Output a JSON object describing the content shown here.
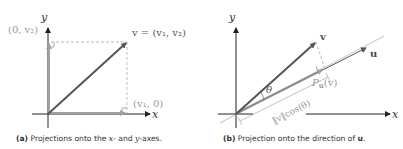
{
  "panel_a": {
    "axis_x": "x",
    "axis_y": "y",
    "label_v": "v = (v₁, v₂)",
    "label_proj_y": "(0, v₂)",
    "label_proj_x": "(v₁, 0)",
    "caption_tag": "(a)",
    "caption_pre": "Projections onto the ",
    "caption_x": "x",
    "caption_mid": "- and ",
    "caption_y": "y",
    "caption_post": "-axes."
  },
  "panel_b": {
    "axis_x": "x",
    "axis_y": "y",
    "label_v": "v",
    "label_u": "u",
    "label_theta": "θ",
    "label_proj": "P",
    "label_proj_sub": "u",
    "label_proj_arg": "(v)",
    "label_length": "‖v‖cos(θ)",
    "caption_tag": "(b)",
    "caption_pre": "Projection onto the direction of ",
    "caption_u": "u",
    "caption_post": "."
  },
  "colors": {
    "vector": "#555555",
    "projection": "#9a9a9a",
    "axis": "#222222",
    "dashed": "#9a9a9a"
  }
}
